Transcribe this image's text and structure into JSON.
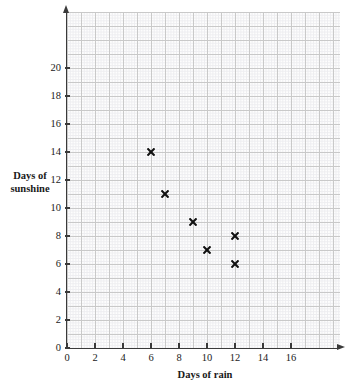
{
  "chart_data": {
    "type": "scatter",
    "title": "",
    "xlabel": "Days of rain",
    "ylabel": "Days of sunshine",
    "xlim": [
      0,
      19.5
    ],
    "ylim": [
      0,
      24
    ],
    "grid": true,
    "legend": "none",
    "x_ticks": [
      0,
      2,
      4,
      6,
      8,
      10,
      12,
      14,
      16
    ],
    "y_ticks": [
      0,
      2,
      4,
      6,
      8,
      10,
      12,
      14,
      16,
      18,
      20
    ],
    "x": [
      6,
      7,
      9,
      10,
      12,
      12
    ],
    "y": [
      14,
      11,
      9,
      7,
      8,
      6
    ],
    "points": [
      {
        "x": 6,
        "y": 14
      },
      {
        "x": 7,
        "y": 11
      },
      {
        "x": 9,
        "y": 9
      },
      {
        "x": 10,
        "y": 7
      },
      {
        "x": 12,
        "y": 8
      },
      {
        "x": 12,
        "y": 6
      }
    ],
    "marker": "x-cross",
    "marker_color": "#111111",
    "grid_color": "#c9c9c9",
    "minor_grid_color": "#ededf0",
    "axis_color": "#3a3a3a"
  },
  "axis_titles": {
    "x": "Days of rain",
    "y_line1": "Days of",
    "y_line2": "sunshine"
  }
}
